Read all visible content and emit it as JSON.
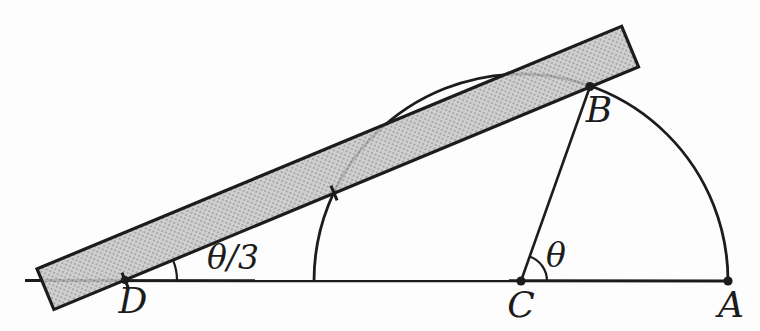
{
  "figure": {
    "points": {
      "a": "A",
      "b": "B",
      "c": "C",
      "d": "D"
    },
    "angles": {
      "at_c": "θ",
      "at_d": "θ/3"
    },
    "colors": {
      "ink": "#1c1c1c",
      "strip_base": "#c9c9c9",
      "strip_dot": "#8e8e8e",
      "background": "#fdfdfd"
    }
  }
}
